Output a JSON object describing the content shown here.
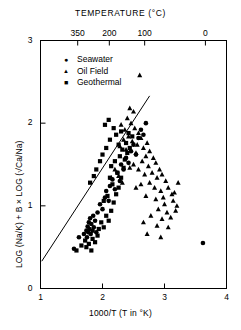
{
  "chart_data": {
    "type": "scatter",
    "title": "TEMPERATURE (°C)",
    "xlabel": "1000/T (T in °K)",
    "ylabel": "LOG (Na/K) + B × LOG (√Ca/Na)",
    "xlim": [
      1,
      4
    ],
    "ylim": [
      0,
      3
    ],
    "xticks": [
      1,
      2,
      3,
      4
    ],
    "xticklabels": [
      "1",
      "2",
      "3",
      "4"
    ],
    "yticks": [
      0,
      1,
      2,
      3
    ],
    "yticklabels": [
      "0",
      "1",
      "2",
      "3"
    ],
    "grid": false,
    "top_axis": {
      "label": "TEMPERATURE (°C)",
      "ticks_x": [
        1.6,
        2.11,
        2.68,
        3.66
      ],
      "ticklabels": [
        "350",
        "200",
        "100",
        "0"
      ]
    },
    "legend": {
      "position": "upper-left-inside",
      "entries": [
        {
          "label": "Seawater",
          "marker": "circle",
          "color": "#000000"
        },
        {
          "label": "Oil Field",
          "marker": "triangle",
          "color": "#000000"
        },
        {
          "label": "Geothermal",
          "marker": "square",
          "color": "#000000"
        }
      ]
    },
    "trendline": {
      "x": [
        1.02,
        2.76
      ],
      "y": [
        0.33,
        2.33
      ],
      "color": "#000000"
    },
    "series": [
      {
        "name": "Seawater",
        "marker": "circle",
        "points": [
          [
            1.62,
            0.62
          ],
          [
            1.7,
            0.66
          ],
          [
            1.74,
            0.7
          ],
          [
            1.75,
            0.62
          ],
          [
            1.76,
            0.75
          ],
          [
            1.77,
            0.68
          ],
          [
            1.78,
            0.8
          ],
          [
            1.79,
            0.72
          ],
          [
            1.8,
            0.85
          ],
          [
            1.81,
            0.66
          ],
          [
            1.82,
            0.78
          ],
          [
            1.84,
            0.7
          ],
          [
            1.85,
            0.88
          ],
          [
            1.86,
            0.74
          ],
          [
            1.88,
            0.82
          ],
          [
            1.9,
            0.68
          ],
          [
            1.54,
            0.48
          ],
          [
            1.92,
            0.92
          ],
          [
            1.96,
            1.02
          ],
          [
            2.0,
            0.96
          ],
          [
            2.04,
            1.1
          ],
          [
            2.06,
            1.18
          ],
          [
            2.1,
            1.06
          ],
          [
            2.12,
            1.24
          ],
          [
            2.16,
            1.32
          ],
          [
            2.2,
            1.2
          ],
          [
            2.24,
            1.4
          ],
          [
            2.28,
            1.3
          ],
          [
            2.3,
            1.5
          ],
          [
            2.34,
            1.44
          ],
          [
            2.38,
            1.58
          ],
          [
            2.42,
            1.52
          ],
          [
            2.46,
            1.66
          ],
          [
            2.5,
            1.74
          ],
          [
            2.54,
            1.62
          ],
          [
            2.58,
            1.82
          ],
          [
            2.62,
            1.92
          ],
          [
            2.66,
            1.86
          ],
          [
            2.7,
            2.0
          ],
          [
            3.62,
            0.55
          ]
        ]
      },
      {
        "name": "Oil Field",
        "marker": "triangle",
        "points": [
          [
            2.6,
            2.58
          ],
          [
            2.44,
            2.18
          ],
          [
            2.5,
            2.14
          ],
          [
            2.4,
            2.06
          ],
          [
            2.46,
            2.0
          ],
          [
            2.3,
            1.98
          ],
          [
            2.36,
            1.92
          ],
          [
            2.52,
            1.94
          ],
          [
            2.58,
            1.88
          ],
          [
            2.42,
            1.84
          ],
          [
            2.34,
            1.8
          ],
          [
            2.48,
            1.78
          ],
          [
            2.56,
            1.74
          ],
          [
            2.62,
            1.82
          ],
          [
            2.66,
            1.7
          ],
          [
            2.72,
            1.76
          ],
          [
            2.28,
            1.72
          ],
          [
            2.38,
            1.68
          ],
          [
            2.54,
            1.64
          ],
          [
            2.7,
            1.6
          ],
          [
            2.76,
            1.66
          ],
          [
            2.82,
            1.58
          ],
          [
            2.64,
            1.54
          ],
          [
            2.5,
            1.5
          ],
          [
            2.44,
            1.46
          ],
          [
            2.58,
            1.44
          ],
          [
            2.74,
            1.48
          ],
          [
            2.86,
            1.52
          ],
          [
            2.92,
            1.44
          ],
          [
            2.68,
            1.38
          ],
          [
            2.8,
            1.4
          ],
          [
            2.88,
            1.34
          ],
          [
            2.96,
            1.38
          ],
          [
            3.02,
            1.3
          ],
          [
            2.76,
            1.28
          ],
          [
            2.62,
            1.26
          ],
          [
            2.54,
            1.22
          ],
          [
            2.84,
            1.22
          ],
          [
            2.94,
            1.18
          ],
          [
            3.06,
            1.22
          ],
          [
            3.12,
            1.14
          ],
          [
            2.98,
            1.1
          ],
          [
            2.86,
            1.08
          ],
          [
            2.7,
            1.12
          ],
          [
            3.0,
            1.02
          ],
          [
            3.14,
            1.06
          ],
          [
            3.2,
            1.0
          ],
          [
            2.9,
            0.96
          ],
          [
            3.04,
            0.92
          ],
          [
            3.18,
            0.94
          ],
          [
            2.78,
            0.88
          ],
          [
            2.96,
            0.84
          ],
          [
            3.1,
            0.86
          ],
          [
            2.66,
            0.8
          ],
          [
            2.88,
            0.76
          ],
          [
            3.06,
            0.74
          ],
          [
            2.72,
            0.66
          ],
          [
            2.94,
            0.62
          ],
          [
            3.16,
            1.16
          ],
          [
            3.22,
            1.28
          ],
          [
            2.26,
            1.36
          ],
          [
            2.32,
            1.28
          ],
          [
            2.2,
            1.44
          ],
          [
            2.14,
            1.34
          ]
        ]
      },
      {
        "name": "Geothermal",
        "marker": "square",
        "points": [
          [
            1.58,
            0.46
          ],
          [
            1.66,
            0.52
          ],
          [
            1.72,
            0.58
          ],
          [
            1.78,
            0.54
          ],
          [
            1.84,
            0.6
          ],
          [
            1.88,
            0.56
          ],
          [
            1.92,
            0.64
          ],
          [
            1.74,
            0.5
          ],
          [
            1.82,
            0.46
          ],
          [
            1.94,
            0.72
          ],
          [
            1.98,
            0.8
          ],
          [
            2.02,
            0.74
          ],
          [
            2.06,
            0.88
          ],
          [
            2.1,
            0.82
          ],
          [
            2.14,
            0.94
          ],
          [
            2.18,
            1.04
          ],
          [
            2.08,
            1.12
          ],
          [
            2.02,
            1.06
          ],
          [
            2.22,
            1.14
          ],
          [
            2.26,
            1.22
          ],
          [
            2.16,
            1.26
          ],
          [
            2.12,
            1.34
          ],
          [
            2.24,
            1.4
          ],
          [
            2.3,
            1.34
          ],
          [
            2.34,
            1.46
          ],
          [
            2.2,
            1.54
          ],
          [
            2.14,
            1.48
          ],
          [
            2.28,
            1.6
          ],
          [
            2.36,
            1.56
          ],
          [
            2.32,
            1.68
          ],
          [
            2.26,
            1.74
          ],
          [
            2.4,
            1.64
          ],
          [
            2.38,
            1.76
          ],
          [
            2.44,
            1.7
          ],
          [
            2.22,
            1.86
          ],
          [
            2.3,
            1.9
          ],
          [
            2.18,
            1.94
          ],
          [
            2.42,
            1.88
          ],
          [
            2.12,
            1.8
          ],
          [
            2.06,
            1.7
          ],
          [
            2.0,
            1.62
          ],
          [
            1.96,
            1.54
          ],
          [
            1.9,
            1.44
          ],
          [
            2.48,
            1.84
          ],
          [
            2.04,
            1.98
          ],
          [
            2.1,
            2.04
          ],
          [
            1.86,
            1.36
          ],
          [
            1.8,
            1.28
          ]
        ]
      }
    ]
  }
}
